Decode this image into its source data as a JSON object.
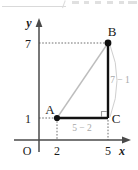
{
  "figure": {
    "kind": "coordinate-plane-right-triangle",
    "axes": {
      "x_label": "x",
      "y_label": "y",
      "origin_label": "O"
    },
    "ticks": {
      "x": [
        {
          "label": "2",
          "value": 2
        },
        {
          "label": "5",
          "value": 5
        }
      ],
      "y": [
        {
          "label": "1",
          "value": 1
        },
        {
          "label": "7",
          "value": 7
        }
      ]
    },
    "points": [
      {
        "name": "A",
        "label": "A",
        "x": 2,
        "y": 1
      },
      {
        "name": "B",
        "label": "B",
        "x": 5,
        "y": 7
      },
      {
        "name": "C",
        "label": "C",
        "x": 5,
        "y": 1
      }
    ],
    "segments": [
      {
        "name": "hypotenuse-ab",
        "from": "A",
        "to": "B",
        "style": "light"
      },
      {
        "name": "leg-ac",
        "from": "A",
        "to": "C",
        "style": "bold"
      },
      {
        "name": "leg-bc",
        "from": "B",
        "to": "C",
        "style": "bold"
      }
    ],
    "right_angle_at": "C",
    "measure_labels": {
      "horizontal": "5 − 2",
      "vertical": "7 − 1"
    },
    "colors": {
      "stroke": "#111111",
      "light_stroke": "#bdbdbd",
      "gray_text": "#a8a8a8",
      "axis": "#4a4a4a",
      "dotted": "#6e6e6e",
      "background": "#ffffff"
    }
  }
}
